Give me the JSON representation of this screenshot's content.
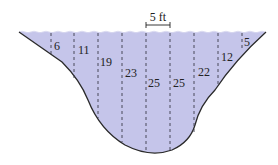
{
  "diagram": {
    "scale_label": "5 ft",
    "colors": {
      "water": "#c5c5ea",
      "outline": "#2a2a2a",
      "dash": "#3a3a4a"
    },
    "depths": [
      {
        "label": "6",
        "x": 51,
        "y": 52
      },
      {
        "label": "11",
        "x": 77,
        "y": 57
      },
      {
        "label": "19",
        "x": 101,
        "y": 67
      },
      {
        "label": "23",
        "x": 125,
        "y": 77
      },
      {
        "label": "25",
        "x": 149,
        "y": 86
      },
      {
        "label": "25",
        "x": 173,
        "y": 86
      },
      {
        "label": "22",
        "x": 198,
        "y": 75
      },
      {
        "label": "12",
        "x": 221,
        "y": 60
      },
      {
        "label": "5",
        "x": 244,
        "y": 46
      }
    ]
  }
}
